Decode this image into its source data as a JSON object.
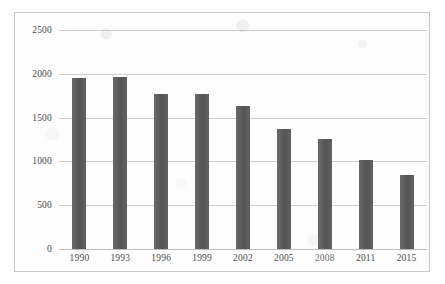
{
  "chart_data": {
    "type": "bar",
    "title": "",
    "subtitle": "",
    "xlabel": "",
    "ylabel": "",
    "categories": [
      "1990",
      "1993",
      "1996",
      "1999",
      "2002",
      "2005",
      "2008",
      "2011",
      "2015"
    ],
    "values": [
      1950,
      1960,
      1770,
      1770,
      1630,
      1370,
      1255,
      1015,
      845
    ],
    "series": [
      {
        "name": "",
        "values": [
          1950,
          1960,
          1770,
          1770,
          1630,
          1370,
          1255,
          1015,
          845
        ]
      }
    ],
    "ylim": [
      0,
      2500
    ],
    "yticks": [
      0,
      500,
      1000,
      1500,
      2000,
      2500
    ],
    "ytick_labels": [
      "0",
      "500",
      "1000",
      "1500",
      "2000",
      "2500"
    ],
    "grid": true,
    "grid_axis": "y",
    "legend": false,
    "legend_position": "none",
    "bar_color": "#595959",
    "gridline_color": "#cfcfcf",
    "axis_text_color": "#4a4a4a",
    "plot_background": "#fdfdfd",
    "frame_border_color": "#c9c9c9",
    "annotations": []
  }
}
